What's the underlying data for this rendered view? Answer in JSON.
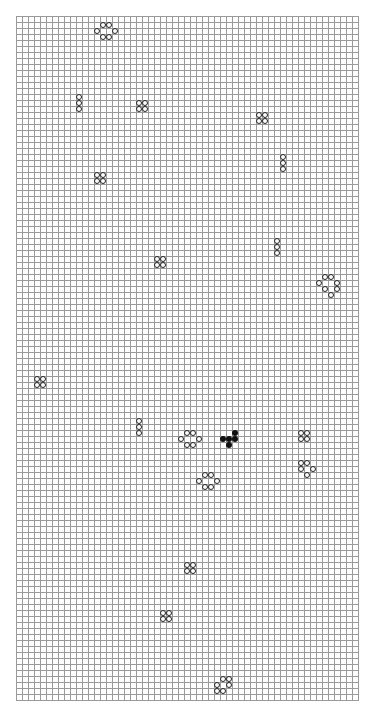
{
  "board": {
    "origin_x": 16,
    "origin_y": 16,
    "cell_size": 6,
    "cols": 57,
    "rows": 114,
    "grid_color": "#9a9a9a",
    "outline_cells": [
      [
        14,
        1
      ],
      [
        15,
        1
      ],
      [
        13,
        2
      ],
      [
        16,
        2
      ],
      [
        14,
        3
      ],
      [
        15,
        3
      ],
      [
        10,
        13
      ],
      [
        10,
        14
      ],
      [
        10,
        15
      ],
      [
        20,
        14
      ],
      [
        21,
        14
      ],
      [
        20,
        15
      ],
      [
        21,
        15
      ],
      [
        40,
        16
      ],
      [
        41,
        16
      ],
      [
        40,
        17
      ],
      [
        41,
        17
      ],
      [
        44,
        23
      ],
      [
        44,
        24
      ],
      [
        44,
        25
      ],
      [
        13,
        26
      ],
      [
        14,
        26
      ],
      [
        13,
        27
      ],
      [
        14,
        27
      ],
      [
        43,
        37
      ],
      [
        43,
        38
      ],
      [
        43,
        39
      ],
      [
        23,
        40
      ],
      [
        24,
        40
      ],
      [
        23,
        41
      ],
      [
        24,
        41
      ],
      [
        51,
        43
      ],
      [
        52,
        43
      ],
      [
        50,
        44
      ],
      [
        53,
        44
      ],
      [
        51,
        45
      ],
      [
        53,
        45
      ],
      [
        52,
        46
      ],
      [
        3,
        60
      ],
      [
        4,
        60
      ],
      [
        3,
        61
      ],
      [
        4,
        61
      ],
      [
        20,
        67
      ],
      [
        20,
        68
      ],
      [
        20,
        69
      ],
      [
        28,
        69
      ],
      [
        29,
        69
      ],
      [
        27,
        70
      ],
      [
        30,
        70
      ],
      [
        28,
        71
      ],
      [
        29,
        71
      ],
      [
        47,
        69
      ],
      [
        48,
        69
      ],
      [
        47,
        70
      ],
      [
        48,
        70
      ],
      [
        47,
        74
      ],
      [
        48,
        74
      ],
      [
        47,
        75
      ],
      [
        49,
        75
      ],
      [
        48,
        76
      ],
      [
        31,
        76
      ],
      [
        32,
        76
      ],
      [
        30,
        77
      ],
      [
        33,
        77
      ],
      [
        31,
        78
      ],
      [
        32,
        78
      ],
      [
        28,
        91
      ],
      [
        29,
        91
      ],
      [
        28,
        92
      ],
      [
        29,
        92
      ],
      [
        24,
        99
      ],
      [
        25,
        99
      ],
      [
        24,
        100
      ],
      [
        25,
        100
      ],
      [
        34,
        110
      ],
      [
        35,
        110
      ],
      [
        33,
        111
      ],
      [
        35,
        111
      ],
      [
        33,
        112
      ],
      [
        34,
        112
      ]
    ],
    "filled_cells": [
      [
        36,
        69
      ],
      [
        34,
        70
      ],
      [
        35,
        70
      ],
      [
        36,
        70
      ],
      [
        35,
        71
      ]
    ]
  }
}
